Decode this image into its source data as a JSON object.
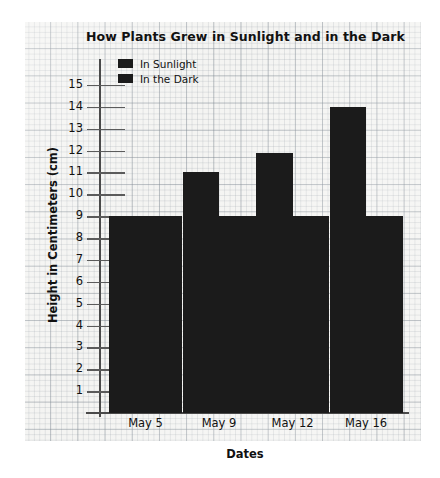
{
  "chart_data": {
    "type": "bar",
    "title": "How Plants Grew in Sunlight and in the Dark",
    "xlabel": "Dates",
    "ylabel": "Height in Centimeters (cm)",
    "categories": [
      "May 5",
      "May 9",
      "May 12",
      "May 16"
    ],
    "series": [
      {
        "name": "In Sunlight",
        "values": [
          9,
          11,
          11.9,
          14
        ],
        "color": "#1b1b1b"
      },
      {
        "name": "In the Dark",
        "values": [
          9,
          9,
          9,
          9
        ],
        "color": "#1b1b1b"
      }
    ],
    "yticks": [
      15,
      14,
      13,
      12,
      11,
      10,
      9,
      8,
      7,
      6,
      5,
      4,
      3,
      2,
      1
    ],
    "ylim": [
      0,
      16
    ],
    "grid": true,
    "legend_position": "top-left",
    "background": "graph-paper"
  }
}
